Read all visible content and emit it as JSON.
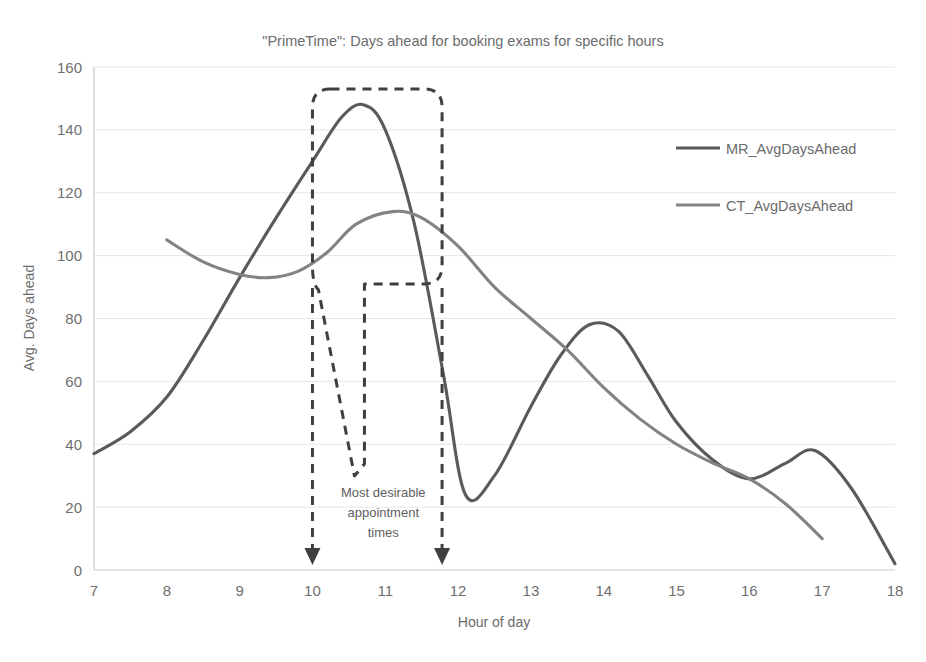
{
  "chart_data": {
    "type": "line",
    "title": "\"PrimeTime\": Days ahead for booking exams for specific hours",
    "xlabel": "Hour of day",
    "ylabel": "Avg. Days ahead",
    "xlim": [
      7,
      18
    ],
    "ylim": [
      0,
      160
    ],
    "xticks": [
      7,
      8,
      9,
      10,
      11,
      12,
      13,
      14,
      15,
      16,
      17,
      18
    ],
    "yticks": [
      0,
      20,
      40,
      60,
      80,
      100,
      120,
      140,
      160
    ],
    "grid": "horizontal",
    "legend_position": "right",
    "series": [
      {
        "name": "MR_AvgDaysAhead",
        "color": "#5a5a5a",
        "x": [
          7,
          7.5,
          8,
          8.5,
          9,
          9.5,
          10,
          10.4,
          10.7,
          11,
          11.4,
          11.8,
          12.1,
          12.5,
          13,
          13.4,
          13.8,
          14.2,
          14.6,
          15,
          15.5,
          16,
          16.5,
          16.9,
          17.4,
          18
        ],
        "values": [
          37,
          44,
          55,
          73,
          93,
          112,
          130,
          144,
          148,
          140,
          110,
          62,
          24,
          30,
          52,
          68,
          78,
          76,
          62,
          47,
          35,
          29,
          34,
          38,
          26,
          2
        ]
      },
      {
        "name": "CT_AvgDaysAhead",
        "color": "#838383",
        "x": [
          8,
          8.5,
          9,
          9.4,
          9.8,
          10.2,
          10.6,
          11.1,
          11.5,
          12,
          12.5,
          13,
          13.5,
          14,
          14.5,
          15,
          15.5,
          16,
          16.5,
          17
        ],
        "values": [
          105,
          98,
          94,
          93,
          95,
          101,
          110,
          114,
          112,
          103,
          90,
          80,
          70,
          58,
          48,
          40,
          34,
          29,
          21,
          10
        ]
      }
    ],
    "annotations": [
      {
        "name": "most-desirable-window",
        "text": "Most desirable appointment times",
        "text_lines": [
          "Most desirable",
          "appointment",
          "times"
        ],
        "x_start": 10.0,
        "x_end": 11.78,
        "callout_top": 153,
        "callout_bottom": 91,
        "notch_min": 35
      }
    ]
  },
  "legend": {
    "items": [
      {
        "label": "MR_AvgDaysAhead",
        "color": "#5a5a5a"
      },
      {
        "label": "CT_AvgDaysAhead",
        "color": "#838383"
      }
    ]
  },
  "colors": {
    "mr_line": "#5a5a5a",
    "ct_line": "#838383",
    "callout": "#3f3f3f",
    "gridline": "#e6e6e6",
    "axis": "#c9c9c9",
    "text": "#6b6b6b",
    "background": "#ffffff"
  }
}
